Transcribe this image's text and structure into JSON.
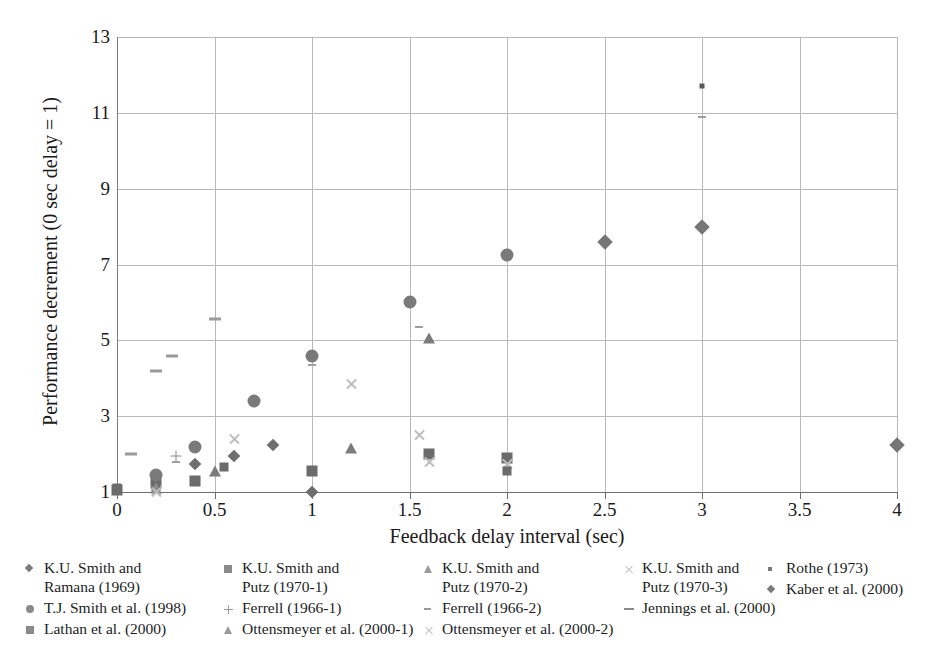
{
  "chart_data": {
    "type": "scatter",
    "title": "",
    "xlabel": "Feedback delay interval (sec)",
    "ylabel": "Performance decrement (0 sec delay = 1)",
    "xlim": [
      0,
      4
    ],
    "ylim": [
      1,
      13
    ],
    "xticks": [
      "0",
      "0.5",
      "1",
      "1.5",
      "2",
      "2.5",
      "3",
      "3.5",
      "4"
    ],
    "xtick_values": [
      0,
      0.5,
      1,
      1.5,
      2,
      2.5,
      3,
      3.5,
      4
    ],
    "yticks": [
      "1",
      "3",
      "5",
      "7",
      "9",
      "11",
      "13"
    ],
    "ytick_values": [
      1,
      3,
      5,
      7,
      9,
      11,
      13
    ],
    "grid": true,
    "legend_position": "bottom",
    "series": [
      {
        "name": "K.U. Smith and Ramana (1969)",
        "marker": "diamond",
        "color": "#6e6e6e",
        "points": [
          {
            "x": 0.4,
            "y": 1.75
          },
          {
            "x": 0.6,
            "y": 1.95
          },
          {
            "x": 0.8,
            "y": 2.25
          },
          {
            "x": 1.0,
            "y": 1.0
          }
        ]
      },
      {
        "name": "K.U. Smith and Putz (1970-1)",
        "marker": "square",
        "color": "#6b6b6b",
        "points": [
          {
            "x": 0.0,
            "y": 1.05
          },
          {
            "x": 0.2,
            "y": 1.25
          },
          {
            "x": 0.4,
            "y": 1.3
          },
          {
            "x": 1.0,
            "y": 1.55
          },
          {
            "x": 1.6,
            "y": 2.0
          },
          {
            "x": 2.0,
            "y": 1.9
          }
        ]
      },
      {
        "name": "K.U. Smith and Putz (1970-2)",
        "marker": "triangle",
        "color": "#7c7c7c",
        "points": [
          {
            "x": 0.5,
            "y": 1.55
          },
          {
            "x": 1.2,
            "y": 2.15
          },
          {
            "x": 1.6,
            "y": 5.05
          }
        ]
      },
      {
        "name": "K.U. Smith and Putz (1970-3)",
        "marker": "cross",
        "color": "#bdbdbd",
        "points": [
          {
            "x": 0.2,
            "y": 1.05
          },
          {
            "x": 0.6,
            "y": 2.4
          },
          {
            "x": 1.2,
            "y": 3.85
          },
          {
            "x": 1.55,
            "y": 2.5
          },
          {
            "x": 1.6,
            "y": 1.8
          },
          {
            "x": 2.0,
            "y": 1.75
          }
        ]
      },
      {
        "name": "Rothe (1973)",
        "marker": "tiny-square",
        "color": "#5a5a5a",
        "points": [
          {
            "x": 3.0,
            "y": 11.7
          }
        ]
      },
      {
        "name": "T.J. Smith et al. (1998)",
        "marker": "circle",
        "color": "#7a7a7a",
        "points": [
          {
            "x": 0.2,
            "y": 1.45
          },
          {
            "x": 0.4,
            "y": 2.2
          },
          {
            "x": 0.7,
            "y": 3.4
          },
          {
            "x": 1.0,
            "y": 4.6
          },
          {
            "x": 1.5,
            "y": 6.0
          },
          {
            "x": 2.0,
            "y": 7.25
          }
        ]
      },
      {
        "name": "Ferrell (1966-1)",
        "marker": "plus",
        "color": "#8c8c8c",
        "points": [
          {
            "x": 0.3,
            "y": 1.95
          }
        ]
      },
      {
        "name": "Ferrell (1966-2)",
        "marker": "dash-small",
        "color": "#9f9f9f",
        "points": [
          {
            "x": 0.3,
            "y": 1.8
          },
          {
            "x": 1.0,
            "y": 4.35
          },
          {
            "x": 1.55,
            "y": 5.35
          },
          {
            "x": 3.0,
            "y": 10.9
          }
        ]
      },
      {
        "name": "Jennings et al. (2000)",
        "marker": "dash",
        "color": "#9a9a9a",
        "points": [
          {
            "x": 0.07,
            "y": 2.0
          },
          {
            "x": 0.2,
            "y": 4.2
          },
          {
            "x": 0.28,
            "y": 4.6
          },
          {
            "x": 0.5,
            "y": 5.55
          }
        ]
      },
      {
        "name": "Kaber et al. (2000)",
        "marker": "diamond-large",
        "color": "#767676",
        "points": [
          {
            "x": 2.5,
            "y": 7.6
          },
          {
            "x": 3.0,
            "y": 8.0
          },
          {
            "x": 4.0,
            "y": 2.25
          }
        ]
      },
      {
        "name": "Lathan et al. (2000)",
        "marker": "square-small",
        "color": "#6b6b6b",
        "points": [
          {
            "x": 0.0,
            "y": 1.1
          },
          {
            "x": 0.2,
            "y": 1.15
          },
          {
            "x": 0.55,
            "y": 1.65
          },
          {
            "x": 2.0,
            "y": 1.55
          }
        ]
      },
      {
        "name": "Ottensmeyer et al. (2000-1)",
        "marker": "triangle",
        "color": "#8e8e8e",
        "points": [
          {
            "x": 0.2,
            "y": 1.1
          }
        ]
      },
      {
        "name": "Ottensmeyer et al. (2000-2)",
        "marker": "cross",
        "color": "#c2c2c2",
        "points": [
          {
            "x": 0.2,
            "y": 1.0
          }
        ]
      }
    ]
  },
  "legend": {
    "columns": [
      {
        "left": 0,
        "width": 200,
        "entries": [
          {
            "label": "K.U. Smith and\nRamana (1969)",
            "swatch": "sw-diamond",
            "icon_name": "legend-marker-diamond"
          },
          {
            "label": "T.J. Smith et al. (1998)",
            "swatch": "sw-circle",
            "icon_name": "legend-marker-circle"
          },
          {
            "label": "Lathan et al. (2000)",
            "swatch": "sw-square",
            "icon_name": "legend-marker-square"
          }
        ]
      },
      {
        "left": 198,
        "width": 230,
        "entries": [
          {
            "label": "K.U. Smith and\nPutz (1970-1)",
            "swatch": "sw-square",
            "icon_name": "legend-marker-square"
          },
          {
            "label": "Ferrell (1966-1)",
            "swatch": "sw-plus",
            "icon_name": "legend-marker-plus"
          },
          {
            "label": "Ottensmeyer et al. (2000-1)",
            "swatch": "sw-triangle",
            "icon_name": "legend-marker-triangle"
          }
        ]
      },
      {
        "left": 398,
        "width": 230,
        "entries": [
          {
            "label": "K.U. Smith and\nPutz (1970-2)",
            "swatch": "sw-triangle",
            "icon_name": "legend-marker-triangle"
          },
          {
            "label": "Ferrell (1966-2)",
            "swatch": "sw-dash",
            "icon_name": "legend-marker-dash"
          },
          {
            "label": "Ottensmeyer et al. (2000-2)",
            "swatch": "sw-cross",
            "icon_name": "legend-marker-cross"
          }
        ]
      },
      {
        "left": 598,
        "width": 180,
        "entries": [
          {
            "label": "K.U. Smith and\nPutz (1970-3)",
            "swatch": "sw-cross",
            "icon_name": "legend-marker-cross"
          },
          {
            "label": "Jennings et al. (2000)",
            "swatch": "sw-dash-long",
            "icon_name": "legend-marker-dash-long"
          }
        ]
      },
      {
        "left": 742,
        "width": 170,
        "entries": [
          {
            "label": "Rothe (1973)",
            "swatch": "sw-tinysq",
            "icon_name": "legend-marker-tiny-square"
          },
          {
            "label": "Kaber et al. (2000)",
            "swatch": "sw-diamond",
            "icon_name": "legend-marker-diamond"
          }
        ]
      }
    ]
  }
}
